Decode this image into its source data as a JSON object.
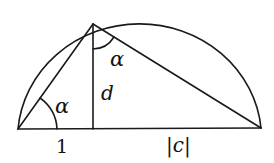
{
  "diagram": {
    "type": "geometry",
    "colors": {
      "stroke": "#1a1a1a",
      "background": "#ffffff"
    },
    "labels": {
      "angle_left": "α",
      "angle_top": "α",
      "altitude": "d",
      "left_segment": "1",
      "right_segment": "|c|"
    },
    "points": {
      "left": [
        18,
        129
      ],
      "apex": [
        93,
        24
      ],
      "foot": [
        93,
        129
      ],
      "right": [
        261,
        128
      ]
    }
  }
}
